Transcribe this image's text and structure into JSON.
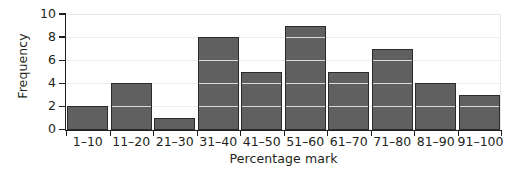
{
  "chart_data": {
    "type": "bar",
    "title": "",
    "subtitle": "",
    "xlabel": "Percentage mark",
    "ylabel": "Frequency",
    "categories": [
      "1–10",
      "11–20",
      "21–30",
      "31–40",
      "41–50",
      "51–60",
      "61–70",
      "71–80",
      "81–90",
      "91–100"
    ],
    "values": [
      2,
      4,
      1,
      8,
      5,
      9,
      5,
      7,
      4,
      3
    ],
    "ylim": [
      0,
      10
    ],
    "ytick_labels": [
      "0",
      "2",
      "4",
      "6",
      "8",
      "10"
    ],
    "ytick_values": [
      0,
      2,
      4,
      6,
      8,
      10
    ],
    "grid": true,
    "grid_axis": "y",
    "legend": null,
    "legend_position": "none",
    "annotations": [],
    "colors": {
      "bar_fill": "#606060",
      "bar_border": "#2b2b2b",
      "gridline": "#ededed",
      "axis": "#231f20",
      "background": "#ffffff",
      "text": "#231f20"
    }
  }
}
